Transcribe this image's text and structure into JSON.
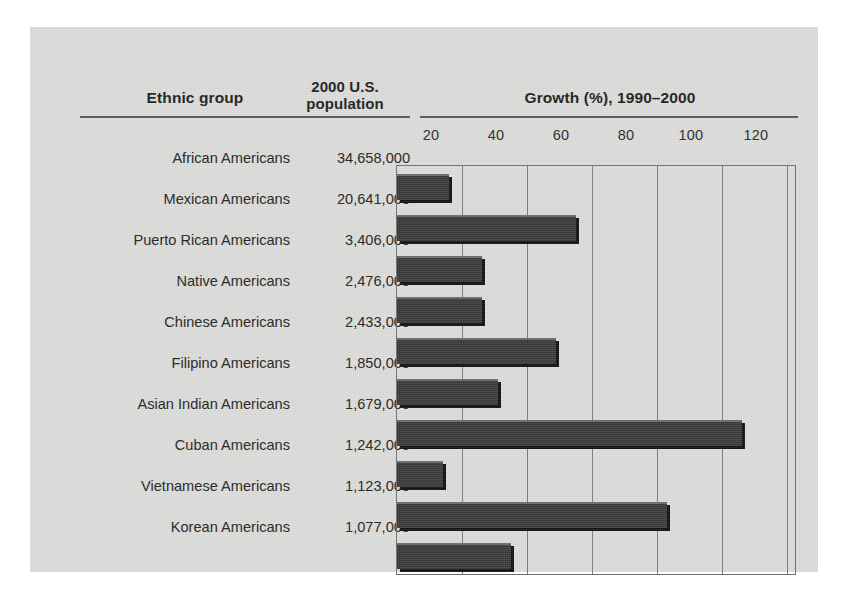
{
  "headers": {
    "group": "Ethnic group",
    "population": "2000 U.S.\npopulation",
    "population_line1": "2000 U.S.",
    "population_line2": "population",
    "growth": "Growth (%), 1990–2000"
  },
  "colors": {
    "panel_background": "#dcdcda",
    "bar_fill": "#3a3a38",
    "bar_shadow": "#111110",
    "grid": "#7a7b7d",
    "rule": "#55565a",
    "text": "#232320"
  },
  "chart_data": {
    "type": "bar",
    "orientation": "horizontal",
    "title": "Growth (%), 1990–2000",
    "xlabel": "Growth (%), 1990–2000",
    "ylabel": "Ethnic group",
    "xlim": [
      0,
      123
    ],
    "grid": true,
    "legend": false,
    "tick_labels": [
      "20",
      "40",
      "60",
      "80",
      "100",
      "120"
    ],
    "ticks": [
      20,
      40,
      60,
      80,
      100,
      120
    ],
    "categories": [
      "African Americans",
      "Mexican Americans",
      "Puerto Rican Americans",
      "Native Americans",
      "Chinese Americans",
      "Filipino Americans",
      "Asian Indian Americans",
      "Cuban Americans",
      "Vietnamese Americans",
      "Korean Americans"
    ],
    "values": [
      16,
      55,
      26,
      26,
      49,
      31,
      106,
      14,
      83,
      35
    ],
    "populations": [
      "34,658,000",
      "20,641,000",
      "3,406,000",
      "2,476,000",
      "2,433,000",
      "1,850,000",
      "1,679,000",
      "1,242,000",
      "1,123,000",
      "1,077,000"
    ],
    "population_values": [
      34658000,
      20641000,
      3406000,
      2476000,
      2433000,
      1850000,
      1679000,
      1242000,
      1123000,
      1077000
    ]
  }
}
